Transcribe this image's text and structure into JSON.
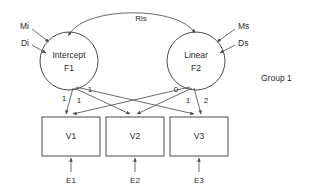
{
  "diagram": {
    "type": "sem-path-diagram",
    "title": "",
    "group_label": "Group 1",
    "colors": {
      "stroke": "#4a4a4a",
      "path": "#5a5a5a",
      "text": "#2b2b2b",
      "background": "#ffffff"
    },
    "latent_factors": [
      {
        "id": "F1",
        "name_line1": "Intercept",
        "name_line2": "F1",
        "cx": 69,
        "cy": 61,
        "r": 29
      },
      {
        "id": "F2",
        "name_line1": "Linear",
        "name_line2": "F2",
        "cx": 196,
        "cy": 61,
        "r": 29
      }
    ],
    "observed_variables": [
      {
        "id": "V1",
        "label": "V1",
        "x": 42,
        "y": 117,
        "w": 58,
        "h": 39
      },
      {
        "id": "V2",
        "label": "V2",
        "x": 106,
        "y": 117,
        "w": 58,
        "h": 39
      },
      {
        "id": "V3",
        "label": "V3",
        "x": 170,
        "y": 117,
        "w": 58,
        "h": 39
      }
    ],
    "error_terms": [
      {
        "id": "E1",
        "label": "E1",
        "x": 71,
        "y": 181
      },
      {
        "id": "E2",
        "label": "E2",
        "x": 135,
        "y": 181
      },
      {
        "id": "E3",
        "label": "E3",
        "x": 199,
        "y": 181
      }
    ],
    "exogenous_inputs": [
      {
        "id": "Mi",
        "label": "Mi",
        "target": "F1",
        "x": 22,
        "y": 27,
        "side": "left"
      },
      {
        "id": "Di",
        "label": "Di",
        "target": "F1",
        "x": 22,
        "y": 44,
        "side": "left"
      },
      {
        "id": "Ms",
        "label": "Ms",
        "target": "F2",
        "x": 242,
        "y": 27,
        "side": "right"
      },
      {
        "id": "Ds",
        "label": "Ds",
        "target": "F2",
        "x": 242,
        "y": 44,
        "side": "right"
      }
    ],
    "covariance": {
      "id": "Ris",
      "label": "Ris",
      "from": "F1",
      "to": "F2",
      "label_x": 141,
      "label_y": 19,
      "double_headed": true
    },
    "loadings": [
      {
        "from": "F1",
        "to": "V1",
        "label": "1",
        "label_x": 64,
        "label_y": 99
      },
      {
        "from": "F1",
        "to": "V2",
        "label": "1",
        "label_x": 79,
        "label_y": 101
      },
      {
        "from": "F1",
        "to": "V3",
        "label": "1",
        "label_x": 90,
        "label_y": 90
      },
      {
        "from": "F2",
        "to": "V1",
        "label": "0",
        "label_x": 176,
        "label_y": 90
      },
      {
        "from": "F2",
        "to": "V2",
        "label": "1",
        "label_x": 188,
        "label_y": 101
      },
      {
        "from": "F2",
        "to": "V3",
        "label": "2",
        "label_x": 205,
        "label_y": 101
      }
    ]
  }
}
